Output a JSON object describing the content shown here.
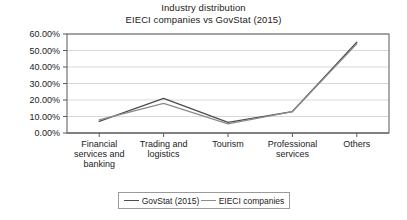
{
  "chart_data": {
    "type": "line",
    "title": "Industry distribution",
    "subtitle": "EIECI companies vs GovStat (2015)",
    "xlabel": "",
    "ylabel": "",
    "categories": [
      "Financial services and banking",
      "Trading and logistics",
      "Tourism",
      "Professional services",
      "Others"
    ],
    "category_lines": [
      [
        "Financial",
        "services and",
        "banking"
      ],
      [
        "Trading and",
        "logistics"
      ],
      [
        "Tourism"
      ],
      [
        "Professional",
        "services"
      ],
      [
        "Others"
      ]
    ],
    "series": [
      {
        "name": "GovStat (2015)",
        "color": "#4d4d4d",
        "values": [
          7.0,
          21.0,
          6.5,
          13.0,
          55.0
        ]
      },
      {
        "name": "EIECI companies",
        "color": "#8c8c8c",
        "values": [
          8.0,
          18.0,
          5.5,
          13.0,
          54.0
        ]
      }
    ],
    "ylim": [
      0,
      60
    ],
    "ytick_values": [
      0,
      10,
      20,
      30,
      40,
      50,
      60
    ],
    "ytick_labels": [
      "0.00%",
      "10.00%",
      "20.00%",
      "30.00%",
      "40.00%",
      "50.00%",
      "60.00%"
    ],
    "grid": true,
    "grid_color": "#d9d9d9",
    "axis_color": "#595959",
    "legend_position": "bottom"
  }
}
